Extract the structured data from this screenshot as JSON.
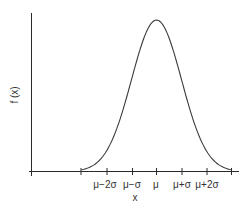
{
  "chart_data": {
    "type": "line",
    "title": "",
    "xlabel": "x",
    "ylabel": "f (x)",
    "x_ticks": [
      "",
      "μ−2σ",
      "μ−σ",
      "μ",
      "μ+σ",
      "μ+2σ",
      ""
    ],
    "x_tick_positions_sigma": [
      -3,
      -2,
      -1,
      0,
      1,
      2,
      3
    ],
    "xlim_sigma": [
      -5,
      3.3
    ],
    "series": [
      {
        "name": "f(x)",
        "distribution": "normal",
        "mean": "μ",
        "std": "σ",
        "x_sigma": [
          -3,
          -2.5,
          -2,
          -1.5,
          -1,
          -0.5,
          0,
          0.5,
          1,
          1.5,
          2,
          2.5,
          3
        ],
        "y_relative": [
          0.011,
          0.044,
          0.135,
          0.325,
          0.607,
          0.882,
          1.0,
          0.882,
          0.607,
          0.325,
          0.135,
          0.044,
          0.011
        ]
      }
    ],
    "grid": false,
    "legend": null
  },
  "labels": {
    "ylabel": "f (x)",
    "xlabel": "x",
    "ticks": {
      "t_m2": "μ−2σ",
      "t_m1": "μ−σ",
      "t_0": "μ",
      "t_p1": "μ+σ",
      "t_p2": "μ+2σ"
    }
  },
  "colors": {
    "axis": "#2a2a2a",
    "curve": "#3a3a3a",
    "text": "#333333",
    "background": "#ffffff"
  }
}
